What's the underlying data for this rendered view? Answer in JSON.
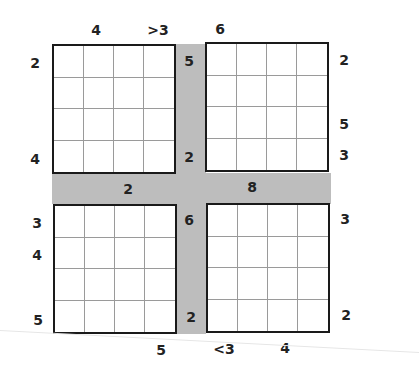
{
  "puzzle": {
    "type": "4-grid skyscraper-style clue puzzle",
    "colors": {
      "band": "#bdbdbd",
      "border": "#1a1a1a",
      "gridline": "#9a9a9a"
    },
    "grids": {
      "top_left": {
        "rows": 4,
        "cols": 4
      },
      "top_right": {
        "rows": 4,
        "cols": 4
      },
      "bottom_left": {
        "rows": 4,
        "cols": 4
      },
      "bottom_right": {
        "rows": 4,
        "cols": 4
      }
    },
    "clues": {
      "tl_top_col2": "4",
      "tl_top_col4": ">3",
      "tl_left_row1": "2",
      "tl_left_row4": "4",
      "band_v_top": "5",
      "band_v_upper_mid": "2",
      "band_v_lower_mid": "6",
      "band_v_bottom": "2",
      "tr_top_col1": "6",
      "tr_right_row1": "2",
      "tr_right_row3": "5",
      "tr_right_row4": "3",
      "band_h_left": "2",
      "band_h_right": "8",
      "bl_left_row1": "3",
      "bl_left_row2": "4",
      "bl_left_row4": "5",
      "bl_bottom_col4": "5",
      "br_right_row1": "3",
      "br_right_row4": "2",
      "br_bottom_col1": "<3",
      "br_bottom_col3": "4"
    }
  }
}
